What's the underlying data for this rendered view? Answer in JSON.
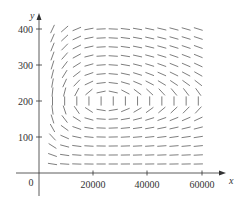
{
  "chart_data": {
    "type": "direction-field",
    "title": "",
    "xlabel": "x",
    "ylabel": "y",
    "origin_label": "0",
    "x_ticks": [
      20000,
      40000,
      60000
    ],
    "x_tick_labels": [
      "20000",
      "40000",
      "60000"
    ],
    "y_ticks": [
      100,
      200,
      300,
      400
    ],
    "y_tick_labels": [
      "100",
      "200",
      "300",
      "400"
    ],
    "xlim": [
      0,
      64000
    ],
    "ylim": [
      0,
      420
    ],
    "grid": false,
    "legend": null,
    "equilibrium": {
      "x": 25000,
      "y": 200
    },
    "field_grid": {
      "x_start": 5000,
      "x_step": 4500,
      "x_count": 13,
      "y_start": 25,
      "y_step": 25,
      "y_count": 16
    },
    "model": "predator-prey: dx/dt = a·x·(1 - y/200), dy/dt = c·y·(x/25000 - 1)",
    "colors": {
      "axis": "#333333",
      "segments": "#6f6f6f"
    }
  },
  "labels": {
    "x_axis": "x",
    "y_axis": "y",
    "origin": "0",
    "x_20000": "20000",
    "x_40000": "40000",
    "x_60000": "60000",
    "y_100": "100",
    "y_200": "200",
    "y_300": "300",
    "y_400": "400"
  }
}
